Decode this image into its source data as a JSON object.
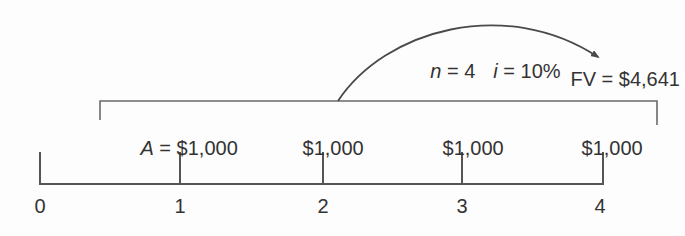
{
  "figure": {
    "annotation": {
      "var1": "n",
      "eq1": " = 4",
      "var2": "i",
      "eq2": " = 10%"
    },
    "future_value_label": "FV = $4,641",
    "payments": [
      {
        "var": "A",
        "amount": " = $1,000"
      },
      {
        "var": "",
        "amount": "$1,000"
      },
      {
        "var": "",
        "amount": "$1,000"
      },
      {
        "var": "",
        "amount": "$1,000"
      }
    ],
    "period_labels": [
      "0",
      "1",
      "2",
      "3",
      "4"
    ],
    "colors": {
      "line": "#555555",
      "bracket": "#6a6a6a",
      "arrow": "#4a4a4a",
      "text": "#333333",
      "background": "#fdfdfd"
    }
  }
}
